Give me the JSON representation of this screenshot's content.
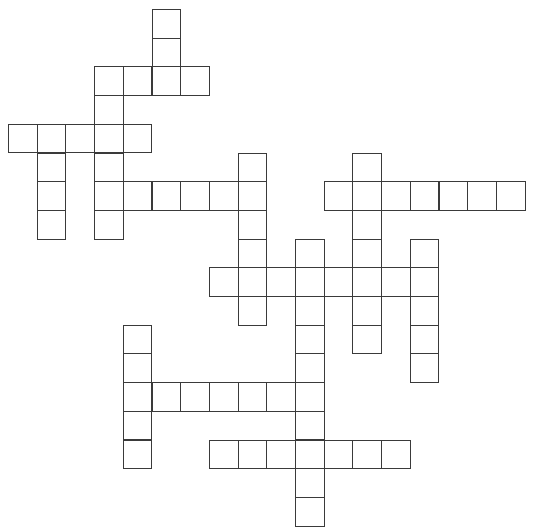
{
  "puzzle": {
    "type": "crossword",
    "cell_size": 28.7,
    "origin": {
      "x": 8,
      "y": 9
    },
    "line_color": "#3a3a3a",
    "cell_fill": "#ffffff",
    "words": [
      {
        "dir": "down",
        "col": 5,
        "row": 0,
        "len": 3
      },
      {
        "dir": "across",
        "col": 3,
        "row": 2,
        "len": 4
      },
      {
        "dir": "down",
        "col": 3,
        "row": 2,
        "len": 6
      },
      {
        "dir": "across",
        "col": 0,
        "row": 4,
        "len": 5
      },
      {
        "dir": "down",
        "col": 1,
        "row": 4,
        "len": 4
      },
      {
        "dir": "across",
        "col": 3,
        "row": 6,
        "len": 6
      },
      {
        "dir": "down",
        "col": 8,
        "row": 5,
        "len": 6
      },
      {
        "dir": "across",
        "col": 11,
        "row": 6,
        "len": 7
      },
      {
        "dir": "down",
        "col": 12,
        "row": 5,
        "len": 7
      },
      {
        "dir": "down",
        "col": 10,
        "row": 8,
        "len": 10
      },
      {
        "dir": "across",
        "col": 7,
        "row": 9,
        "len": 8
      },
      {
        "dir": "down",
        "col": 14,
        "row": 8,
        "len": 5
      },
      {
        "dir": "down",
        "col": 4,
        "row": 11,
        "len": 5
      },
      {
        "dir": "across",
        "col": 4,
        "row": 13,
        "len": 7
      },
      {
        "dir": "across",
        "col": 7,
        "row": 15,
        "len": 7
      }
    ]
  }
}
